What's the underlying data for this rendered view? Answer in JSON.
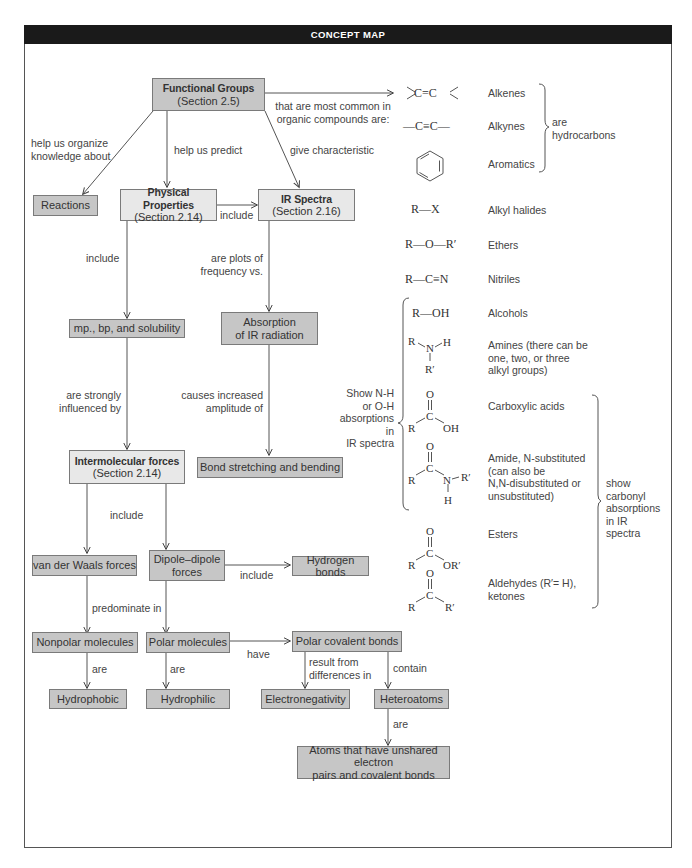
{
  "header": {
    "title": "CONCEPT MAP"
  },
  "nodes": {
    "functional_groups": {
      "title": "Functional Groups",
      "sub": "(Section 2.5)"
    },
    "reactions": {
      "label": "Reactions"
    },
    "physical_properties": {
      "title": "Physical Properties",
      "sub": "(Section 2.14)"
    },
    "ir_spectra": {
      "title": "IR Spectra",
      "sub": "(Section 2.16)"
    },
    "mp_bp": {
      "label": "mp., bp, and solubility"
    },
    "absorption": {
      "line1": "Absorption",
      "line2": "of IR radiation"
    },
    "intermolecular": {
      "title": "Intermolecular forces",
      "sub": "(Section 2.14)"
    },
    "bond_stretching": {
      "label": "Bond stretching and bending"
    },
    "vdw": {
      "label": "van der Waals forces"
    },
    "dipole": {
      "line1": "Dipole–dipole",
      "line2": "forces"
    },
    "hydrogen_bonds": {
      "label": "Hydrogen bonds"
    },
    "nonpolar": {
      "label": "Nonpolar molecules"
    },
    "polar_molecules": {
      "label": "Polar molecules"
    },
    "polar_covalent": {
      "label": "Polar covalent bonds"
    },
    "hydrophobic": {
      "label": "Hydrophobic"
    },
    "hydrophilic": {
      "label": "Hydrophilic"
    },
    "electronegativity": {
      "label": "Electronegativity"
    },
    "heteroatoms": {
      "label": "Heteroatoms"
    },
    "atoms_unshared": {
      "line1": "Atoms that have unshared electron",
      "line2": "pairs and covalent bonds"
    }
  },
  "links": {
    "most_common_1": "that are most common in",
    "most_common_2": "organic compounds are:",
    "organize_1": "help us organize",
    "organize_2": "knowledge about",
    "predict": "help us predict",
    "characteristic": "give characteristic",
    "include_ir": "include",
    "include_mp": "include",
    "plots_1": "are plots of",
    "plots_2": "frequency vs.",
    "influenced_1": "are strongly",
    "influenced_2": "influenced by",
    "amplitude_1": "causes increased",
    "amplitude_2": "amplitude of",
    "include_forces": "include",
    "include_hbonds": "include",
    "predominate": "predominate in",
    "are_nonpolar": "are",
    "are_polar": "are",
    "have": "have",
    "result_1": "result from",
    "result_2": "differences in",
    "contain": "contain",
    "are_hetero": "are"
  },
  "groups": {
    "hydrocarbons_note_1": "are",
    "hydrocarbons_note_2": "hydrocarbons",
    "nh_oh_note": [
      "Show N-H",
      "or O-H",
      "absorptions",
      "in",
      "IR spectra"
    ],
    "carbonyl_note": [
      "show",
      "carbonyl",
      "absorptions",
      "in IR",
      "spectra"
    ],
    "items": [
      {
        "formula": "C=C",
        "name": "Alkenes"
      },
      {
        "formula": "—C≡C—",
        "name": "Alkynes"
      },
      {
        "formula": "benzene-ring",
        "name": "Aromatics"
      },
      {
        "formula": "R—X",
        "name": "Alkyl halides"
      },
      {
        "formula": "R—O—R′",
        "name": "Ethers"
      },
      {
        "formula": "R—C≡N",
        "name": "Nitriles"
      },
      {
        "formula": "R—OH",
        "name": "Alcohols"
      },
      {
        "formula": "R2N-H",
        "name_lines": [
          "Amines (there can be",
          "one, two, or three",
          "alkyl groups)"
        ]
      },
      {
        "formula": "RCOOH",
        "name": "Carboxylic acids"
      },
      {
        "formula": "RCONHR′",
        "name_lines": [
          "Amide, N-substituted",
          "(can also be",
          "N,N-disubstituted or",
          "unsubstituted)"
        ]
      },
      {
        "formula": "RCOOR′",
        "name": "Esters"
      },
      {
        "formula": "RCOR′",
        "name_lines": [
          "Aldehydes (R′= H),",
          "ketones"
        ]
      }
    ],
    "formula_text": {
      "alkyne": "—C≡C—",
      "alkyl_halide": "R—X",
      "ether": "R—O—R′",
      "nitrile": "R—C≡N",
      "alcohol": "R—OH"
    }
  }
}
